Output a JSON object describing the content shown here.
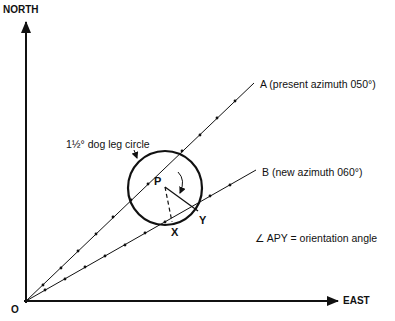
{
  "axes": {
    "north_label": "NORTH",
    "east_label": "EAST",
    "origin_label": "O"
  },
  "lines": {
    "a_label": "A (present azimuth 050°)",
    "b_label": "B (new azimuth 060°)"
  },
  "circle": {
    "label": "1½° dog leg circle"
  },
  "points": {
    "p": "P",
    "x": "X",
    "y": "Y"
  },
  "legend": {
    "angle_note": "∠ APY = orientation angle"
  },
  "colors": {
    "ink": "#111111",
    "background": "#ffffff"
  }
}
